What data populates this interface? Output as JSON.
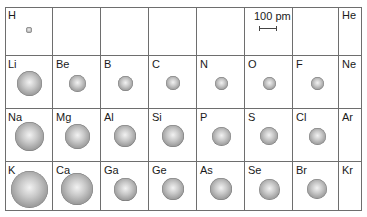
{
  "figure": {
    "type": "atomic-radius periodic table",
    "scale": {
      "label": "100 pm",
      "bar_px": 18
    },
    "columns": 8,
    "rows": 4,
    "cells": [
      {
        "row": 0,
        "col": 0,
        "symbol": "H",
        "d": 6
      },
      {
        "row": 0,
        "col": 1,
        "symbol": "",
        "d": 0
      },
      {
        "row": 0,
        "col": 2,
        "symbol": "",
        "d": 0
      },
      {
        "row": 0,
        "col": 3,
        "symbol": "",
        "d": 0
      },
      {
        "row": 0,
        "col": 4,
        "symbol": "",
        "d": 0
      },
      {
        "row": 0,
        "col": 5,
        "symbol": "",
        "d": 0,
        "scale": true
      },
      {
        "row": 0,
        "col": 6,
        "symbol": "",
        "d": 0
      },
      {
        "row": 0,
        "col": 7,
        "symbol": "He",
        "d": 0
      },
      {
        "row": 1,
        "col": 0,
        "symbol": "Li",
        "d": 25
      },
      {
        "row": 1,
        "col": 1,
        "symbol": "Be",
        "d": 17
      },
      {
        "row": 1,
        "col": 2,
        "symbol": "B",
        "d": 15
      },
      {
        "row": 1,
        "col": 3,
        "symbol": "C",
        "d": 14
      },
      {
        "row": 1,
        "col": 4,
        "symbol": "N",
        "d": 13
      },
      {
        "row": 1,
        "col": 5,
        "symbol": "O",
        "d": 13
      },
      {
        "row": 1,
        "col": 6,
        "symbol": "F",
        "d": 13
      },
      {
        "row": 1,
        "col": 7,
        "symbol": "Ne",
        "d": 0
      },
      {
        "row": 2,
        "col": 0,
        "symbol": "Na",
        "d": 29
      },
      {
        "row": 2,
        "col": 1,
        "symbol": "Mg",
        "d": 25
      },
      {
        "row": 2,
        "col": 2,
        "symbol": "Al",
        "d": 22
      },
      {
        "row": 2,
        "col": 3,
        "symbol": "Si",
        "d": 22
      },
      {
        "row": 2,
        "col": 4,
        "symbol": "P",
        "d": 19
      },
      {
        "row": 2,
        "col": 5,
        "symbol": "S",
        "d": 18
      },
      {
        "row": 2,
        "col": 6,
        "symbol": "Cl",
        "d": 17
      },
      {
        "row": 2,
        "col": 7,
        "symbol": "Ar",
        "d": 0
      },
      {
        "row": 3,
        "col": 0,
        "symbol": "K",
        "d": 37
      },
      {
        "row": 3,
        "col": 1,
        "symbol": "Ca",
        "d": 32
      },
      {
        "row": 3,
        "col": 2,
        "symbol": "Ga",
        "d": 23
      },
      {
        "row": 3,
        "col": 3,
        "symbol": "Ge",
        "d": 22
      },
      {
        "row": 3,
        "col": 4,
        "symbol": "As",
        "d": 22
      },
      {
        "row": 3,
        "col": 5,
        "symbol": "Se",
        "d": 21
      },
      {
        "row": 3,
        "col": 6,
        "symbol": "Br",
        "d": 20
      },
      {
        "row": 3,
        "col": 7,
        "symbol": "Kr",
        "d": 0
      }
    ]
  }
}
